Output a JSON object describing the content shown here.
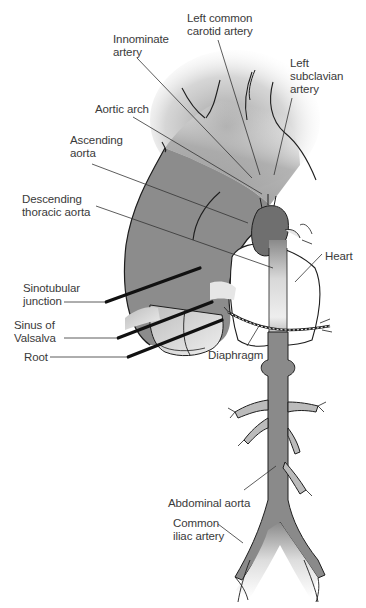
{
  "diagram": {
    "colors": {
      "vessel": "#8a8a8a",
      "vessel_dark": "#6f6f6f",
      "outline": "#1e1e1e",
      "marker": "#111111",
      "leader": "#333333",
      "text": "#3a3a3a",
      "background": "#ffffff"
    },
    "labels": {
      "innominate": {
        "line1": "Innominate",
        "line2": "artery"
      },
      "left_common_carotid": {
        "line1": "Left common",
        "line2": "carotid artery"
      },
      "left_subclavian": {
        "line1": "Left",
        "line2": "subclavian",
        "line3": "artery"
      },
      "aortic_arch": {
        "line1": "Aortic arch"
      },
      "ascending_aorta": {
        "line1": "Ascending",
        "line2": "aorta"
      },
      "descending_thoracic": {
        "line1": "Descending",
        "line2": "thoracic aorta"
      },
      "heart": {
        "line1": "Heart"
      },
      "sinotubular": {
        "line1": "Sinotubular",
        "line2": "junction"
      },
      "sinus_valsalva": {
        "line1": "Sinus of",
        "line2": "Valsalva"
      },
      "root": {
        "line1": "Root"
      },
      "diaphragm": {
        "line1": "Diaphragm"
      },
      "abdominal_aorta": {
        "line1": "Abdominal aorta"
      },
      "common_iliac": {
        "line1": "Common",
        "line2": "iliac artery"
      }
    }
  }
}
